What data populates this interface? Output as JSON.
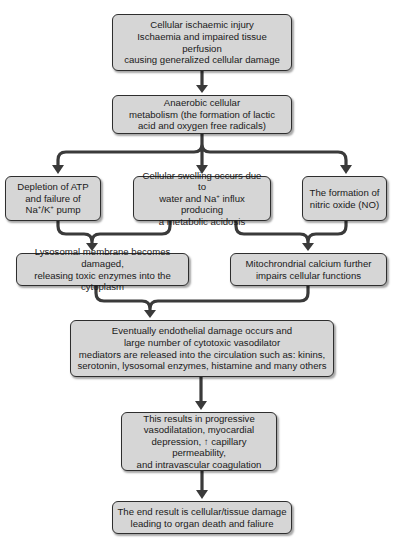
{
  "diagram": {
    "colors": {
      "box_fill": "#d6d6d6",
      "box_border": "#2e2e2e",
      "arrow": "#3a3a3a",
      "background": "#ffffff"
    },
    "nodes": [
      {
        "id": "cellular-ischaemic-injury",
        "text": "Cellular ischaemic injury\nIschaemia and impaired tissue perfusion\ncausing generalized cellular damage"
      },
      {
        "id": "anaerobic-metabolism",
        "text": "Anaerobic cellular\nmetabolism (the formation of lactic\nacid and oxygen free radicals)"
      },
      {
        "id": "atp-depletion",
        "text_parts": [
          "Depletion of ATP\nand failure of\nNa",
          "+",
          "/K",
          "+",
          " pump"
        ]
      },
      {
        "id": "cellular-swelling",
        "text_parts": [
          "Cellular swelling occurs due to\nwater and Na",
          "+",
          " influx producing\na metabolic acidosis"
        ]
      },
      {
        "id": "nitric-oxide",
        "text": "The formation of\nnitric oxide (NO)"
      },
      {
        "id": "lysosomal-damage",
        "text": "Lysosomal membrane becomes damaged,\nreleasing toxic enzymes into the cytoplasm"
      },
      {
        "id": "mitochondrial-calcium",
        "text": "Mitochrondrial calcium further\nimpairs cellular functions"
      },
      {
        "id": "endothelial-damage",
        "text": "Eventually endothelial damage occurs and\nlarge number of cytotoxic vasodilator\nmediators are released into the circulation such as: kinins,\nserotonin, lysosomal enzymes, histamine and many others"
      },
      {
        "id": "progressive-vasodilatation",
        "text": "This results in progressive\nvasodilatation, myocardial\ndepression, ↑ capillary permeability,\nand intravascular coagulation"
      },
      {
        "id": "end-result",
        "text": "The end result is cellular/tissue damage\nleading to organ death and faliure"
      }
    ],
    "edges": [
      {
        "from": "cellular-ischaemic-injury",
        "to": "anaerobic-metabolism"
      },
      {
        "from": "anaerobic-metabolism",
        "to": "atp-depletion"
      },
      {
        "from": "anaerobic-metabolism",
        "to": "cellular-swelling"
      },
      {
        "from": "anaerobic-metabolism",
        "to": "nitric-oxide"
      },
      {
        "from": "atp-depletion",
        "to": "lysosomal-damage"
      },
      {
        "from": "cellular-swelling",
        "to": "lysosomal-damage"
      },
      {
        "from": "cellular-swelling",
        "to": "mitochondrial-calcium"
      },
      {
        "from": "nitric-oxide",
        "to": "mitochondrial-calcium"
      },
      {
        "from": "lysosomal-damage",
        "to": "endothelial-damage"
      },
      {
        "from": "mitochondrial-calcium",
        "to": "endothelial-damage"
      },
      {
        "from": "endothelial-damage",
        "to": "progressive-vasodilatation"
      },
      {
        "from": "progressive-vasodilatation",
        "to": "end-result"
      }
    ]
  }
}
